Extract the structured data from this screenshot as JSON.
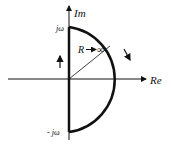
{
  "diagram": {
    "axes": {
      "imaginary_label": "Im",
      "real_label": "Re"
    },
    "labels": {
      "top_point": "jω",
      "bottom_point": "- jω",
      "radius": "R",
      "radius_arrow": "→",
      "radius_limit": "∞"
    },
    "icons": {
      "up_arrow": "arrow-up-icon",
      "clockwise_arrow": "arrow-down-right-icon"
    },
    "colors": {
      "stroke": "#111111",
      "background": "#ffffff"
    }
  }
}
